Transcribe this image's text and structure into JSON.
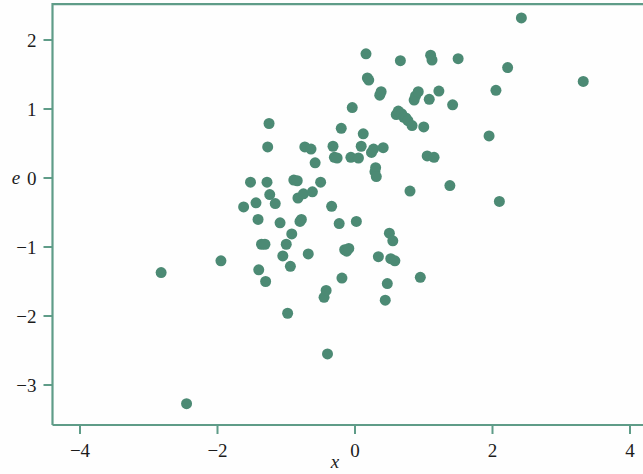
{
  "chart_data": {
    "type": "scatter",
    "title": "",
    "xlabel": "x",
    "ylabel": "e",
    "xlim": [
      -4.4,
      4.12
    ],
    "ylim": [
      -3.58,
      2.52
    ],
    "xticks": [
      -4,
      -2,
      0,
      2,
      4
    ],
    "xticklabels": [
      "−4",
      "−2",
      "0",
      "2",
      "4"
    ],
    "yticks": [
      2,
      1,
      0,
      -1,
      -2,
      -3
    ],
    "yticklabels": [
      "2",
      "1",
      "0",
      "−1",
      "−2",
      "−3"
    ],
    "grid": false,
    "legend": null,
    "marker": {
      "shape": "circle",
      "color": "#4c8a74",
      "size_px": 11,
      "opacity": 1
    },
    "frame_color": "#5f9c88",
    "points": [
      {
        "x": -2.82,
        "y": -1.37
      },
      {
        "x": -2.45,
        "y": -3.27
      },
      {
        "x": -1.95,
        "y": -1.2
      },
      {
        "x": -1.62,
        "y": -0.42
      },
      {
        "x": -1.52,
        "y": -0.06
      },
      {
        "x": -1.44,
        "y": -0.36
      },
      {
        "x": -1.41,
        "y": -0.6
      },
      {
        "x": -1.4,
        "y": -1.33
      },
      {
        "x": -1.36,
        "y": -0.96
      },
      {
        "x": -1.31,
        "y": -0.96
      },
      {
        "x": -1.3,
        "y": -1.5
      },
      {
        "x": -1.28,
        "y": -0.06
      },
      {
        "x": -1.27,
        "y": 0.45
      },
      {
        "x": -1.25,
        "y": 0.79
      },
      {
        "x": -1.24,
        "y": -0.24
      },
      {
        "x": -1.16,
        "y": -0.37
      },
      {
        "x": -1.09,
        "y": -0.65
      },
      {
        "x": -1.05,
        "y": -1.13
      },
      {
        "x": -1.0,
        "y": -0.96
      },
      {
        "x": -0.98,
        "y": -1.96
      },
      {
        "x": -0.94,
        "y": -1.28
      },
      {
        "x": -0.92,
        "y": -0.81
      },
      {
        "x": -0.89,
        "y": -0.03
      },
      {
        "x": -0.84,
        "y": -0.04
      },
      {
        "x": -0.83,
        "y": -0.29
      },
      {
        "x": -0.8,
        "y": -0.63
      },
      {
        "x": -0.78,
        "y": -0.6
      },
      {
        "x": -0.75,
        "y": -0.23
      },
      {
        "x": -0.73,
        "y": 0.45
      },
      {
        "x": -0.68,
        "y": -1.1
      },
      {
        "x": -0.64,
        "y": 0.42
      },
      {
        "x": -0.62,
        "y": -0.2
      },
      {
        "x": -0.58,
        "y": 0.22
      },
      {
        "x": -0.5,
        "y": -0.06
      },
      {
        "x": -0.45,
        "y": -1.73
      },
      {
        "x": -0.42,
        "y": -1.63
      },
      {
        "x": -0.4,
        "y": -2.55
      },
      {
        "x": -0.34,
        "y": -0.41
      },
      {
        "x": -0.32,
        "y": 0.46
      },
      {
        "x": -0.3,
        "y": 0.3
      },
      {
        "x": -0.26,
        "y": 0.29
      },
      {
        "x": -0.23,
        "y": -0.66
      },
      {
        "x": -0.2,
        "y": 0.72
      },
      {
        "x": -0.19,
        "y": -1.45
      },
      {
        "x": -0.15,
        "y": -1.04
      },
      {
        "x": -0.12,
        "y": -1.06
      },
      {
        "x": -0.09,
        "y": -1.02
      },
      {
        "x": -0.06,
        "y": 0.3
      },
      {
        "x": -0.04,
        "y": 1.02
      },
      {
        "x": 0.02,
        "y": -0.63
      },
      {
        "x": 0.05,
        "y": 0.29
      },
      {
        "x": 0.09,
        "y": 0.46
      },
      {
        "x": 0.12,
        "y": 0.64
      },
      {
        "x": 0.16,
        "y": 1.8
      },
      {
        "x": 0.18,
        "y": 1.45
      },
      {
        "x": 0.2,
        "y": 1.42
      },
      {
        "x": 0.24,
        "y": 0.37
      },
      {
        "x": 0.27,
        "y": 0.42
      },
      {
        "x": 0.29,
        "y": 0.09
      },
      {
        "x": 0.3,
        "y": 0.15
      },
      {
        "x": 0.31,
        "y": 0.02
      },
      {
        "x": 0.34,
        "y": -1.14
      },
      {
        "x": 0.36,
        "y": 1.2
      },
      {
        "x": 0.38,
        "y": 1.25
      },
      {
        "x": 0.41,
        "y": 0.44
      },
      {
        "x": 0.44,
        "y": -1.77
      },
      {
        "x": 0.47,
        "y": -1.53
      },
      {
        "x": 0.5,
        "y": -0.8
      },
      {
        "x": 0.52,
        "y": -1.17
      },
      {
        "x": 0.55,
        "y": -0.91
      },
      {
        "x": 0.58,
        "y": -1.2
      },
      {
        "x": 0.6,
        "y": 0.92
      },
      {
        "x": 0.63,
        "y": 0.97
      },
      {
        "x": 0.66,
        "y": 1.7
      },
      {
        "x": 0.68,
        "y": 0.93
      },
      {
        "x": 0.71,
        "y": 0.88
      },
      {
        "x": 0.74,
        "y": 0.87
      },
      {
        "x": 0.77,
        "y": 0.83
      },
      {
        "x": 0.8,
        "y": -0.19
      },
      {
        "x": 0.83,
        "y": 0.76
      },
      {
        "x": 0.86,
        "y": 1.13
      },
      {
        "x": 0.88,
        "y": 1.19
      },
      {
        "x": 0.92,
        "y": 1.25
      },
      {
        "x": 0.95,
        "y": -1.44
      },
      {
        "x": 1.0,
        "y": 0.74
      },
      {
        "x": 1.05,
        "y": 0.32
      },
      {
        "x": 1.08,
        "y": 1.14
      },
      {
        "x": 1.1,
        "y": 1.78
      },
      {
        "x": 1.12,
        "y": 1.71
      },
      {
        "x": 1.15,
        "y": 0.3
      },
      {
        "x": 1.22,
        "y": 1.26
      },
      {
        "x": 1.38,
        "y": -0.11
      },
      {
        "x": 1.42,
        "y": 1.06
      },
      {
        "x": 1.5,
        "y": 1.73
      },
      {
        "x": 1.95,
        "y": 0.61
      },
      {
        "x": 2.05,
        "y": 1.27
      },
      {
        "x": 2.1,
        "y": -0.34
      },
      {
        "x": 2.22,
        "y": 1.6
      },
      {
        "x": 2.42,
        "y": 2.32
      },
      {
        "x": 3.32,
        "y": 1.4
      }
    ]
  },
  "axes": {
    "x_title": "x",
    "y_title": "e"
  }
}
